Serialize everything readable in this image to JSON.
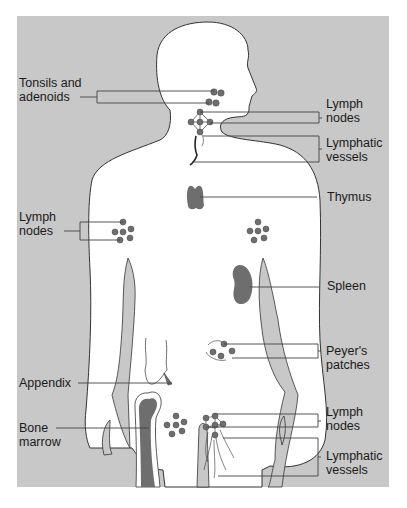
{
  "figure": {
    "type": "anatomical-diagram",
    "colors": {
      "background_panel": "#c8c8c8",
      "body_fill": "#ffffff",
      "organ_fill": "#6e6e6e",
      "outline": "#333333",
      "leader_line": "#444444",
      "text": "#1a1a1a"
    }
  },
  "labels": {
    "tonsils": {
      "line1": "Tonsils and",
      "line2": "adenoids"
    },
    "neck_nodes": {
      "line1": "Lymph",
      "line2": "nodes"
    },
    "neck_vessels": {
      "line1": "Lymphatic",
      "line2": "vessels"
    },
    "thymus": {
      "line1": "Thymus"
    },
    "armpit_nodes": {
      "line1": "Lymph",
      "line2": "nodes"
    },
    "spleen": {
      "line1": "Spleen"
    },
    "peyers": {
      "line1": "Peyer's",
      "line2": "patches"
    },
    "appendix": {
      "line1": "Appendix"
    },
    "bone_marrow": {
      "line1": "Bone",
      "line2": "marrow"
    },
    "groin_nodes": {
      "line1": "Lymph",
      "line2": "nodes"
    },
    "groin_vessels": {
      "line1": "Lymphatic",
      "line2": "vessels"
    }
  }
}
